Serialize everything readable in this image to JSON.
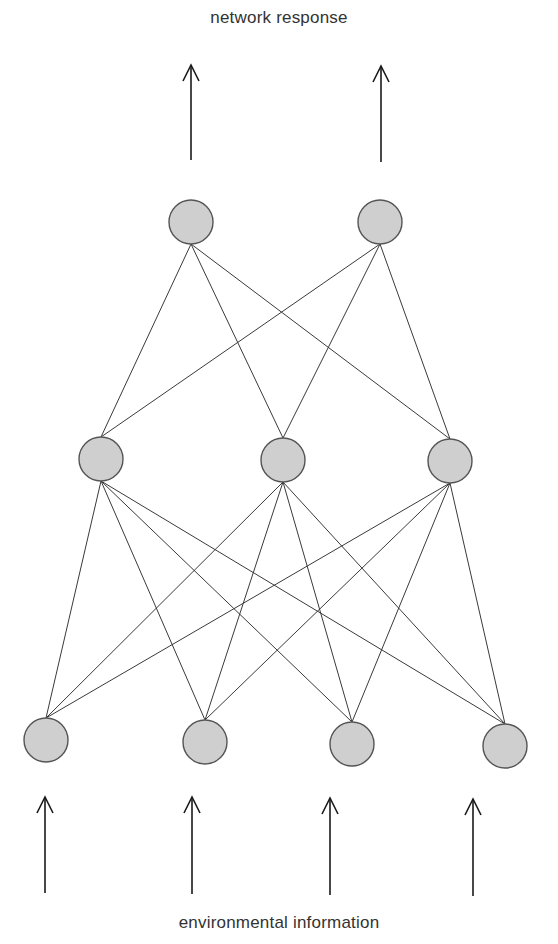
{
  "diagram": {
    "title_top": "network response",
    "title_bottom": "environmental information",
    "type": "feedforward neural network",
    "colors": {
      "node_fill": "#cfcfcf",
      "node_stroke": "#555555",
      "edge": "#3a3a3a",
      "arrow": "#1a1a1a",
      "text": "#333333"
    },
    "node_radius": 22,
    "layers": [
      {
        "name": "output",
        "nodes": [
          {
            "id": "o1",
            "x": 191,
            "y": 222
          },
          {
            "id": "o2",
            "x": 380,
            "y": 222
          }
        ]
      },
      {
        "name": "hidden",
        "nodes": [
          {
            "id": "h1",
            "x": 101,
            "y": 459
          },
          {
            "id": "h2",
            "x": 283,
            "y": 460
          },
          {
            "id": "h3",
            "x": 450,
            "y": 461
          }
        ]
      },
      {
        "name": "input",
        "nodes": [
          {
            "id": "i1",
            "x": 46,
            "y": 740
          },
          {
            "id": "i2",
            "x": 205,
            "y": 742
          },
          {
            "id": "i3",
            "x": 352,
            "y": 744
          },
          {
            "id": "i4",
            "x": 505,
            "y": 746
          }
        ]
      }
    ],
    "output_arrows": [
      {
        "x": 191,
        "y1": 160,
        "y2": 65
      },
      {
        "x": 381,
        "y1": 162,
        "y2": 66
      }
    ],
    "input_arrows": [
      {
        "x": 45,
        "y1": 893,
        "y2": 797
      },
      {
        "x": 192,
        "y1": 894,
        "y2": 797
      },
      {
        "x": 330,
        "y1": 895,
        "y2": 798
      },
      {
        "x": 473,
        "y1": 896,
        "y2": 799
      }
    ]
  }
}
